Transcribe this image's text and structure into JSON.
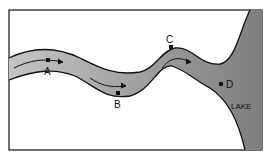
{
  "diagram": {
    "type": "river flowing into lake",
    "points": [
      {
        "label": "A",
        "x": 48,
        "y": 60
      },
      {
        "label": "B",
        "x": 118,
        "y": 93
      },
      {
        "label": "C",
        "x": 171,
        "y": 46
      },
      {
        "label": "D",
        "x": 222,
        "y": 84
      }
    ],
    "lake_label": "LAKE",
    "colors": {
      "water": "#bdbdbd",
      "lake_dark": "#8a8a8a",
      "outline": "#111111"
    }
  }
}
